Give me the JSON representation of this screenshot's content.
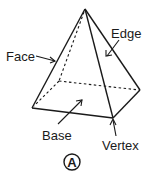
{
  "diagram": {
    "labels": {
      "face": "Face",
      "edge": "Edge",
      "base": "Base",
      "vertex": "Vertex"
    },
    "choice_marker": "A",
    "colors": {
      "stroke": "#1a1a1a",
      "background": "#ffffff"
    }
  }
}
